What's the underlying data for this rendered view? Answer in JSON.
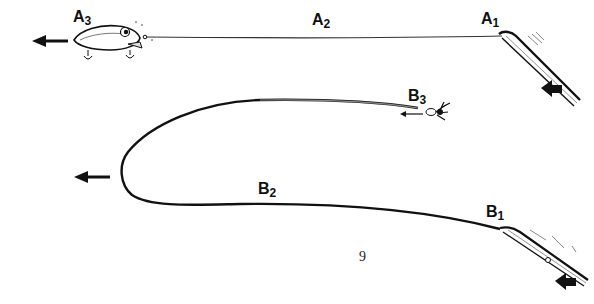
{
  "diagram": {
    "title": "",
    "page_number": "9",
    "colors": {
      "ink": "#111111",
      "background": "#ffffff"
    },
    "top_figure": {
      "labels": [
        {
          "id": "A1",
          "letter": "A",
          "sub": "1"
        },
        {
          "id": "A2",
          "letter": "A",
          "sub": "2"
        },
        {
          "id": "A3",
          "letter": "A",
          "sub": "3"
        }
      ],
      "elements": [
        "crankbait-lure",
        "fishing-line",
        "rod-tip",
        "pull-arrow-left",
        "rod-push-arrow"
      ]
    },
    "bottom_figure": {
      "labels": [
        {
          "id": "B1",
          "letter": "B",
          "sub": "1"
        },
        {
          "id": "B2",
          "letter": "B",
          "sub": "2"
        },
        {
          "id": "B3",
          "letter": "B",
          "sub": "3"
        }
      ],
      "elements": [
        "fly-lure",
        "looped-fly-line",
        "rod-tip",
        "loop-direction-arrow",
        "fly-direction-arrow",
        "rod-push-arrow"
      ]
    }
  }
}
